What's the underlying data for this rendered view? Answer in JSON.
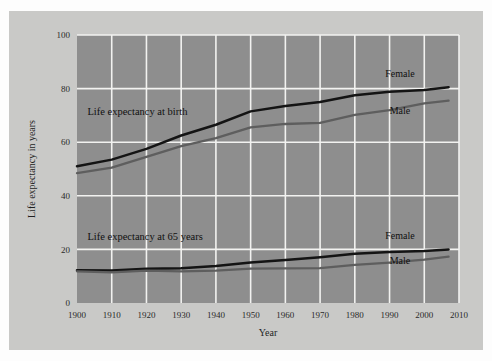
{
  "figure": {
    "background_color": "#c9c9c7",
    "plot_background_color": "#8e8e8e",
    "grid_color": "#f2f2f0"
  },
  "chart_data": {
    "type": "line",
    "title": "",
    "subtitle": "",
    "xlabel": "Year",
    "ylabel": "Life expectancy in years",
    "xlim": [
      1900,
      2010
    ],
    "ylim": [
      0,
      100
    ],
    "grid": true,
    "legend_position": "inline-end-of-line",
    "xticks": [
      1900,
      1910,
      1920,
      1930,
      1940,
      1950,
      1960,
      1970,
      1980,
      1990,
      2000,
      2010
    ],
    "xtick_labels": [
      "1900",
      "1910",
      "1920",
      "1930",
      "1940",
      "1950",
      "1960",
      "1970",
      "1980",
      "1990",
      "2000",
      "2010"
    ],
    "yticks": [
      0,
      20,
      40,
      60,
      80,
      100
    ],
    "ytick_labels": [
      "0",
      "20",
      "40",
      "60",
      "80",
      "100"
    ],
    "annotations": [
      {
        "text": "Life expectancy at birth",
        "x": 1903,
        "y": 70
      },
      {
        "text": "Life expectancy at 65 years",
        "x": 1903,
        "y": 23.5
      }
    ],
    "x": [
      1900,
      1910,
      1920,
      1930,
      1940,
      1950,
      1960,
      1970,
      1980,
      1990,
      2000,
      2007
    ],
    "series": [
      {
        "name": "Life expectancy at birth — Female",
        "group": "at birth",
        "label": "Female",
        "color": "#141414",
        "label_x": 1993,
        "label_y": 84.5,
        "values": [
          51.0,
          53.5,
          57.5,
          62.5,
          66.5,
          71.5,
          73.5,
          75.0,
          77.5,
          78.8,
          79.5,
          80.5
        ]
      },
      {
        "name": "Life expectancy at birth — Male",
        "group": "at birth",
        "label": "Male",
        "color": "#5e5e5e",
        "label_x": 1993,
        "label_y": 70.5,
        "values": [
          48.5,
          50.5,
          54.5,
          58.5,
          61.5,
          65.5,
          66.8,
          67.2,
          70.2,
          72.0,
          74.5,
          75.5
        ]
      },
      {
        "name": "Life expectancy at 65 years — Female",
        "group": "at 65 years",
        "label": "Female",
        "color": "#141414",
        "label_x": 1993,
        "label_y": 24.0,
        "values": [
          12.2,
          12.1,
          12.8,
          13.0,
          13.8,
          15.1,
          16.0,
          17.1,
          18.4,
          19.0,
          19.4,
          20.0
        ]
      },
      {
        "name": "Life expectancy at 65 years — Male",
        "group": "at 65 years",
        "label": "Male",
        "color": "#5e5e5e",
        "label_x": 1993,
        "label_y": 14.5,
        "values": [
          11.8,
          11.4,
          12.1,
          11.8,
          12.1,
          12.8,
          12.9,
          13.0,
          14.2,
          15.1,
          16.2,
          17.3
        ]
      }
    ]
  }
}
